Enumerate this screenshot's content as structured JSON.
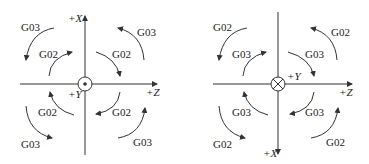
{
  "left_diagram": {
    "axis_x_label": "+X",
    "axis_z_label": "+Z",
    "axis_y_label": "+Y",
    "y_direction_symbol": "dot (out of page)",
    "quadrants": {
      "top_left": {
        "outer": "G03",
        "inner": "G02"
      },
      "top_right": {
        "outer": "G03",
        "inner": "G02"
      },
      "bottom_left": {
        "outer": "G03",
        "inner": "G02"
      },
      "bottom_right": {
        "outer": "G03",
        "inner": "G02"
      }
    }
  },
  "right_diagram": {
    "axis_x_label": "+X",
    "axis_z_label": "+Z",
    "axis_y_label": "+Y",
    "y_direction_symbol": "cross (into page)",
    "quadrants": {
      "top_left": {
        "outer": "G02",
        "inner": "G03"
      },
      "top_right": {
        "outer": "G02",
        "inner": "G03"
      },
      "bottom_left": {
        "outer": "G02",
        "inner": "G03"
      },
      "bottom_right": {
        "outer": "G02",
        "inner": "G03"
      }
    }
  }
}
